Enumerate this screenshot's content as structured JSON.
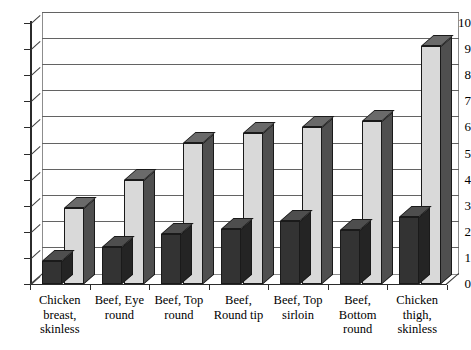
{
  "chart_data": {
    "type": "bar",
    "title": "",
    "subtitle": "",
    "xlabel": "",
    "ylabel": "",
    "ylim": [
      0,
      10
    ],
    "grid": true,
    "legend_position": "none",
    "style": "3d-clustered-column",
    "categories": [
      "Chicken breast, skinless",
      "Beef, Eye round",
      "Beef, Top round",
      "Beef, Round tip",
      "Beef, Top sirloin",
      "Beef, Bottom round",
      "Chicken thigh, skinless"
    ],
    "category_lines": [
      [
        "Chicken",
        "breast,",
        "skinless"
      ],
      [
        "Beef, Eye",
        "round"
      ],
      [
        "Beef, Top",
        "round"
      ],
      [
        "Beef,",
        "Round tip"
      ],
      [
        "Beef, Top",
        "sirloin"
      ],
      [
        "Beef,",
        "Bottom",
        "round"
      ],
      [
        "Chicken",
        "thigh,",
        "skinless"
      ]
    ],
    "yticks": [
      0,
      1,
      2,
      3,
      4,
      5,
      6,
      7,
      8,
      9,
      10
    ],
    "ytick_labels": [
      "0",
      "1",
      "2",
      "3",
      "4",
      "5",
      "6",
      "7",
      "8",
      "9",
      "10"
    ],
    "series": [
      {
        "name": "Series 1",
        "color": "#333333",
        "values": [
          0.9,
          1.4,
          1.9,
          2.1,
          2.4,
          2.05,
          2.55
        ]
      },
      {
        "name": "Series 2",
        "color": "#d9d9d9",
        "values": [
          2.9,
          4.0,
          5.4,
          5.8,
          6.0,
          6.25,
          9.1
        ]
      }
    ]
  },
  "colors": {
    "series1": "#333333",
    "series2": "#d9d9d9",
    "gridline": "#636363",
    "axis": "#2b2b2b",
    "background": "#ffffff"
  }
}
